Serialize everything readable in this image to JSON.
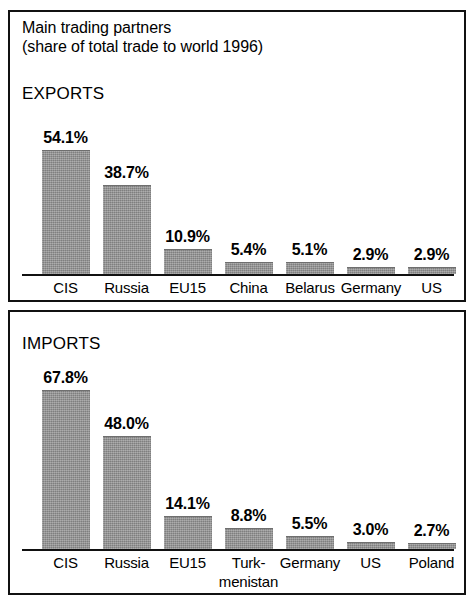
{
  "title": {
    "line1": "Main trading partners",
    "line2": "(share of total trade to world 1996)"
  },
  "panels": [
    {
      "section": "EXPORTS"
    },
    {
      "section": "IMPORTS"
    }
  ],
  "colors": {
    "bar_fill": "#8e8e8e",
    "border": "#111111",
    "background": "#ffffff"
  },
  "chart_data": [
    {
      "type": "bar",
      "title": "EXPORTS",
      "categories": [
        "CIS",
        "Russia",
        "EU15",
        "China",
        "Belarus",
        "Germany",
        "US"
      ],
      "values": [
        54.1,
        38.7,
        10.9,
        5.4,
        5.1,
        2.9,
        2.9
      ],
      "data_labels": [
        "54.1%",
        "38.7%",
        "10.9%",
        "5.4%",
        "5.1%",
        "2.9%",
        "2.9%"
      ],
      "xlabel": "",
      "ylabel": "",
      "ylim": [
        0,
        54.1
      ],
      "grid": false,
      "legend": "none"
    },
    {
      "type": "bar",
      "title": "IMPORTS",
      "categories": [
        "CIS",
        "Russia",
        "EU15",
        "Turk-menistan",
        "Germany",
        "US",
        "Poland"
      ],
      "category_lines": [
        [
          "CIS"
        ],
        [
          "Russia"
        ],
        [
          "EU15"
        ],
        [
          "Turk-",
          "menistan"
        ],
        [
          "Germany"
        ],
        [
          "US"
        ],
        [
          "Poland"
        ]
      ],
      "values": [
        67.8,
        48.0,
        14.1,
        8.8,
        5.5,
        3.0,
        2.7
      ],
      "data_labels": [
        "67.8%",
        "48.0%",
        "14.1%",
        "8.8%",
        "5.5%",
        "3.0%",
        "2.7%"
      ],
      "xlabel": "",
      "ylabel": "",
      "ylim": [
        0,
        67.8
      ],
      "grid": false,
      "legend": "none"
    }
  ]
}
